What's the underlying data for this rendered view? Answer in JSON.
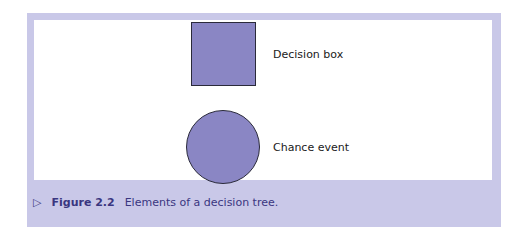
{
  "diagram": {
    "elements": [
      {
        "shape": "square",
        "label": "Decision box",
        "fill": "#8a86c4"
      },
      {
        "shape": "circle",
        "label": "Chance event",
        "fill": "#8a86c4"
      }
    ]
  },
  "caption": {
    "icon": "triangle-right-icon",
    "icon_glyph": "▷",
    "figure_number": "Figure 2.2",
    "text": "Elements of a decision tree."
  },
  "colors": {
    "panel": "#c9c8e8",
    "shape_fill": "#8a86c4",
    "caption_text": "#3a3680"
  }
}
